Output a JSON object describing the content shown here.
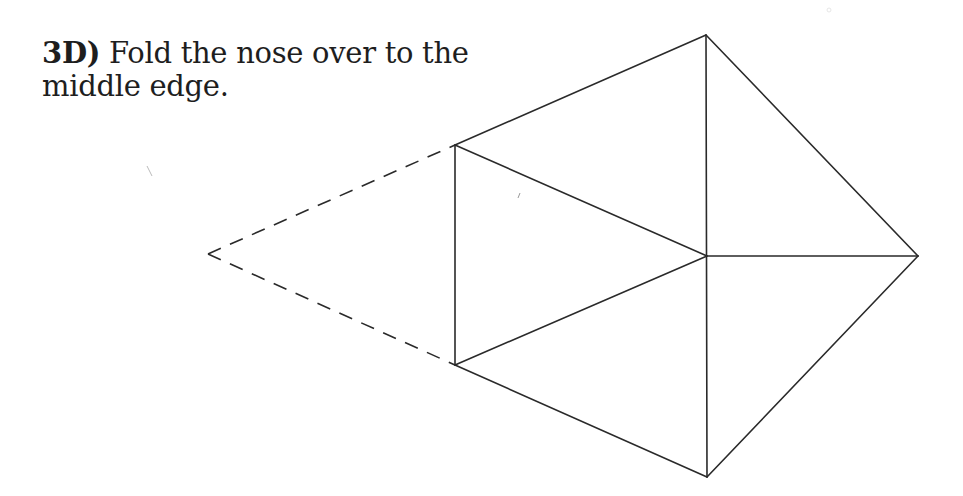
{
  "instruction": {
    "step_label": "3D)",
    "text": "Fold the nose over to the middle edge."
  },
  "diagram": {
    "stroke_color": "#2a2a2a",
    "dashed_color": "#2a2a2a",
    "vertices": {
      "top_apex": [
        706,
        35
      ],
      "right_tip": [
        918,
        256
      ],
      "bottom_apex": [
        707,
        477
      ],
      "center": [
        707,
        256
      ],
      "upper_left": [
        455,
        145
      ],
      "lower_left": [
        455,
        365
      ],
      "nose_tip": [
        208,
        254
      ]
    },
    "solid_edges": [
      [
        "upper_left",
        "top_apex"
      ],
      [
        "top_apex",
        "right_tip"
      ],
      [
        "right_tip",
        "bottom_apex"
      ],
      [
        "bottom_apex",
        "lower_left"
      ],
      [
        "lower_left",
        "upper_left"
      ],
      [
        "top_apex",
        "bottom_apex"
      ],
      [
        "upper_left",
        "center"
      ],
      [
        "lower_left",
        "center"
      ],
      [
        "center",
        "right_tip"
      ]
    ],
    "dashed_edges": [
      [
        "nose_tip",
        "upper_left"
      ],
      [
        "nose_tip",
        "lower_left"
      ]
    ]
  }
}
